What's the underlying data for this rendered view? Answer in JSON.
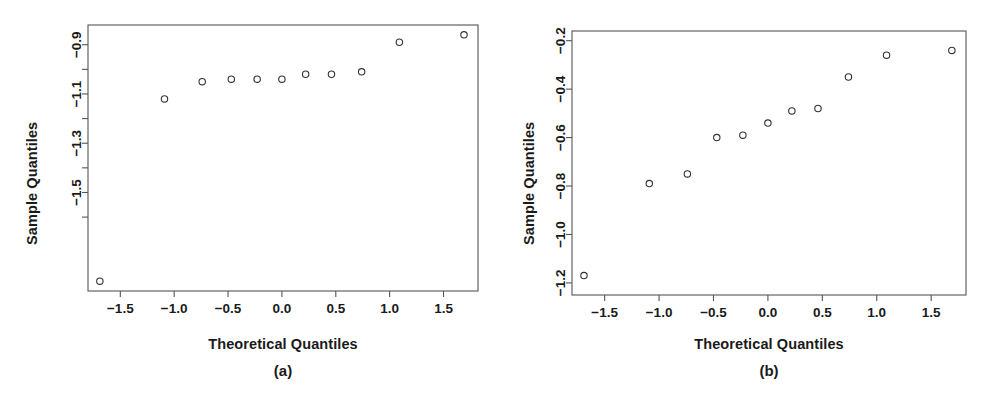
{
  "figure": {
    "background_color": "#ffffff",
    "point_color": "#333333",
    "axis_color": "#555555",
    "text_color": "#1a1a1a"
  },
  "panels": [
    {
      "id": "a",
      "caption": "(a)",
      "xlabel": "Theoretical Quantiles",
      "ylabel": "Sample Quantiles",
      "x_ticks": [
        "-1.5",
        "-1.0",
        "-0.5",
        "0.0",
        "0.5",
        "1.0",
        "1.5"
      ],
      "y_ticks": [
        "-0.9",
        "-1.1",
        "-1.3",
        "-1.5"
      ]
    },
    {
      "id": "b",
      "caption": "(b)",
      "xlabel": "Theoretical Quantiles",
      "ylabel": "Sample Quantiles",
      "x_ticks": [
        "-1.5",
        "-1.0",
        "-0.5",
        "0.0",
        "0.5",
        "1.0",
        "1.5"
      ],
      "y_ticks": [
        "-0.2",
        "-0.4",
        "-0.6",
        "-0.8",
        "-1.0",
        "-1.2"
      ]
    }
  ],
  "chart_data": [
    {
      "type": "scatter",
      "panel": "a",
      "title": "(a)",
      "xlabel": "Theoretical Quantiles",
      "ylabel": "Sample Quantiles",
      "xlim": [
        -1.8,
        1.82
      ],
      "ylim": [
        -1.9,
        -0.82
      ],
      "xticks": [
        -1.5,
        -1.0,
        -0.5,
        0.0,
        0.5,
        1.0,
        1.5
      ],
      "yticks": [
        -0.9,
        -1.1,
        -1.3,
        -1.5
      ],
      "yticks_minor": [
        -1.0,
        -1.2,
        -1.4,
        -1.6
      ],
      "grid": false,
      "legend": false,
      "marker": "open-circle",
      "x": [
        -1.69,
        -1.09,
        -0.74,
        -0.47,
        -0.23,
        0.0,
        0.22,
        0.46,
        0.74,
        1.09,
        1.69
      ],
      "y": [
        -1.86,
        -1.12,
        -1.05,
        -1.04,
        -1.04,
        -1.04,
        -1.02,
        -1.02,
        -1.01,
        -0.89,
        -0.86
      ]
    },
    {
      "type": "scatter",
      "panel": "b",
      "title": "(b)",
      "xlabel": "Theoretical Quantiles",
      "ylabel": "Sample Quantiles",
      "xlim": [
        -1.8,
        1.82
      ],
      "ylim": [
        -1.25,
        -0.16
      ],
      "xticks": [
        -1.5,
        -1.0,
        -0.5,
        0.0,
        0.5,
        1.0,
        1.5
      ],
      "yticks": [
        -0.2,
        -0.4,
        -0.6,
        -0.8,
        -1.0,
        -1.2
      ],
      "grid": false,
      "legend": false,
      "marker": "open-circle",
      "x": [
        -1.69,
        -1.09,
        -0.74,
        -0.47,
        -0.23,
        0.0,
        0.22,
        0.46,
        0.74,
        1.09,
        1.69
      ],
      "y": [
        -1.17,
        -0.79,
        -0.75,
        -0.6,
        -0.59,
        -0.54,
        -0.49,
        -0.48,
        -0.35,
        -0.26,
        -0.24
      ]
    }
  ]
}
